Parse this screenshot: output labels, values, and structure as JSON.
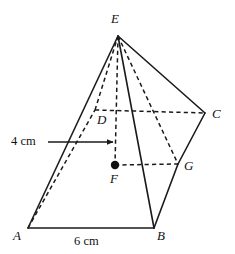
{
  "figure": {
    "name": "square-pyramid-with-dimensions",
    "background_color": "#ffffff",
    "line_color": "#1a1a1a",
    "dot_color": "#111111",
    "width": 235,
    "height": 254
  },
  "vertices": [
    {
      "id": "E",
      "label": "E",
      "x": 118,
      "y": 36,
      "label_x": 111,
      "label_y": 12,
      "kind": "apex"
    },
    {
      "id": "A",
      "label": "A",
      "x": 28,
      "y": 228,
      "label_x": 13,
      "label_y": 229,
      "kind": "base-corner"
    },
    {
      "id": "B",
      "label": "B",
      "x": 154,
      "y": 228,
      "label_x": 157,
      "label_y": 229,
      "kind": "base-corner"
    },
    {
      "id": "C",
      "label": "C",
      "x": 205,
      "y": 113,
      "label_x": 212,
      "label_y": 107,
      "kind": "base-corner"
    },
    {
      "id": "D",
      "label": "D",
      "x": 95,
      "y": 110,
      "label_x": 97,
      "label_y": 113,
      "kind": "base-corner-hidden"
    },
    {
      "id": "G",
      "label": "G",
      "x": 178,
      "y": 164,
      "label_x": 184,
      "label_y": 159,
      "kind": "edge-midpoint"
    },
    {
      "id": "F",
      "label": "F",
      "x": 115,
      "y": 165,
      "label_x": 110,
      "label_y": 172,
      "kind": "base-centre"
    }
  ],
  "center_dot": {
    "vertex": "F",
    "x": 115,
    "y": 165,
    "radius": 4.2
  },
  "edges_solid": [
    {
      "from": "A",
      "to": "B",
      "x1": 28,
      "y1": 228,
      "x2": 154,
      "y2": 228
    },
    {
      "from": "A",
      "to": "E",
      "x1": 28,
      "y1": 228,
      "x2": 118,
      "y2": 36
    },
    {
      "from": "B",
      "to": "E",
      "x1": 154,
      "y1": 228,
      "x2": 118,
      "y2": 36
    },
    {
      "from": "E",
      "to": "C",
      "x1": 118,
      "y1": 36,
      "x2": 205,
      "y2": 113
    },
    {
      "from": "C",
      "to": "G",
      "x1": 205,
      "y1": 113,
      "x2": 178,
      "y2": 164
    },
    {
      "from": "G",
      "to": "B",
      "x1": 178,
      "y1": 164,
      "x2": 154,
      "y2": 228
    }
  ],
  "edges_hidden": [
    {
      "from": "A",
      "to": "D",
      "x1": 28,
      "y1": 228,
      "x2": 95,
      "y2": 110
    },
    {
      "from": "D",
      "to": "E",
      "x1": 95,
      "y1": 110,
      "x2": 118,
      "y2": 36
    },
    {
      "from": "D",
      "to": "C",
      "x1": 95,
      "y1": 110,
      "x2": 205,
      "y2": 113
    },
    {
      "from": "E",
      "to": "G",
      "x1": 118,
      "y1": 36,
      "x2": 178,
      "y2": 164
    },
    {
      "from": "E",
      "to": "F",
      "x1": 118,
      "y1": 36,
      "x2": 115,
      "y2": 165
    },
    {
      "from": "F",
      "to": "G",
      "x1": 115,
      "y1": 165,
      "x2": 178,
      "y2": 164
    }
  ],
  "dimensions": [
    {
      "id": "height-4cm",
      "label": "4 cm",
      "label_x": 11,
      "label_y": 135,
      "arrow": {
        "x1": 48,
        "y1": 142,
        "x2": 115,
        "y2": 142,
        "head": "end"
      }
    },
    {
      "id": "base-6cm",
      "label": "6 cm",
      "label_x": 74,
      "label_y": 235,
      "arrow": null
    }
  ]
}
